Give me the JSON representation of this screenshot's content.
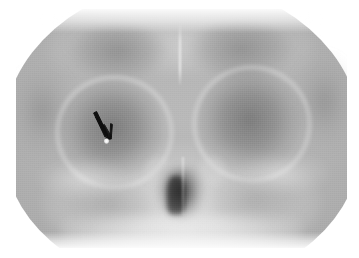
{
  "figure": {
    "modality": "radiograph",
    "view": "frontal sinus / Caldwell projection",
    "caption": ""
  },
  "colors": {
    "background": "#ffffff",
    "film_light": "#b9b9b9",
    "film_mid": "#a8a8a8",
    "film_dark": "#8f8f8f",
    "orbit_shadow": "#6c6c6c",
    "nasal_air": "#2a2a2a",
    "bone_highlight": "#f2f2f2",
    "annotation": "#111111",
    "lesion": "#ffffff"
  },
  "anatomy": [
    {
      "id": "cranial-vault",
      "label": "Cranial vault",
      "interactable": false
    },
    {
      "id": "frontal-sinus-left",
      "label": "Left frontal sinus",
      "interactable": false
    },
    {
      "id": "frontal-sinus-right",
      "label": "Right frontal sinus",
      "interactable": false
    },
    {
      "id": "midline-septum",
      "label": "Frontal sinus septum",
      "interactable": false
    },
    {
      "id": "orbit-left",
      "label": "Left orbit",
      "interactable": false
    },
    {
      "id": "orbit-right",
      "label": "Right orbit",
      "interactable": false
    },
    {
      "id": "orbital-rim-left",
      "label": "Left orbital rim",
      "interactable": false
    },
    {
      "id": "orbital-rim-right",
      "label": "Right orbital rim",
      "interactable": false
    },
    {
      "id": "nasal-cavity",
      "label": "Nasal cavity (air)",
      "interactable": false
    },
    {
      "id": "nasal-septum",
      "label": "Nasal septum",
      "interactable": false
    },
    {
      "id": "turbinate-left",
      "label": "Left turbinate",
      "interactable": false
    },
    {
      "id": "turbinate-right",
      "label": "Right turbinate",
      "interactable": false
    },
    {
      "id": "maxillary-left",
      "label": "Left maxillary sinus",
      "interactable": false
    },
    {
      "id": "maxillary-right",
      "label": "Right maxillary sinus",
      "interactable": false
    },
    {
      "id": "temporal-left",
      "label": "Left temporal region",
      "interactable": false
    },
    {
      "id": "temporal-right",
      "label": "Right temporal region",
      "interactable": false
    },
    {
      "id": "zygomatic-arc-left",
      "label": "Left zygomatic arch",
      "interactable": false
    },
    {
      "id": "zygomatic-arc-right",
      "label": "Right zygomatic arch",
      "interactable": false
    },
    {
      "id": "alveolar-ridge",
      "label": "Alveolar ridge / maxilla",
      "interactable": false
    }
  ],
  "annotation": {
    "type": "arrow",
    "color": "#111111",
    "direction": "down-right",
    "tip_x": 110,
    "tip_y": 136,
    "tail_x": 97,
    "tail_y": 112,
    "points_to": "radiopaque-focus",
    "label": ""
  },
  "finding": {
    "id": "radiopaque-focus",
    "label": "Small radiopaque focus in left orbit",
    "x": 106,
    "y": 141,
    "appearance": "punctate bright density"
  }
}
